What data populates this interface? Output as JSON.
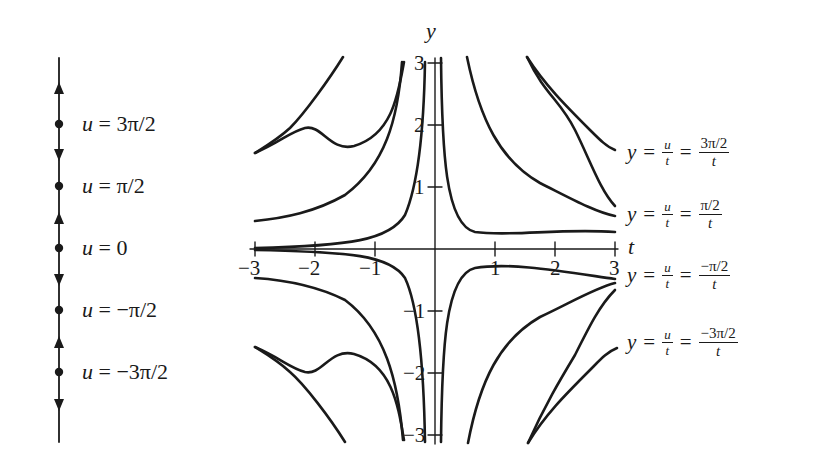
{
  "figure": {
    "colors": {
      "ink": "#1a1a1a",
      "background": "#ffffff"
    }
  },
  "phase_line": {
    "equilibria": [
      {
        "label_var": "u",
        "label_eq": "=",
        "label_value": "3π/2",
        "type": "equilibrium"
      },
      {
        "label_var": "u",
        "label_eq": "=",
        "label_value": "π/2",
        "type": "equilibrium"
      },
      {
        "label_var": "u",
        "label_eq": "=",
        "label_value": "0",
        "type": "equilibrium"
      },
      {
        "label_var": "u",
        "label_eq": "=",
        "label_value": "−π/2",
        "type": "equilibrium"
      },
      {
        "label_var": "u",
        "label_eq": "=",
        "label_value": "−3π/2",
        "type": "equilibrium"
      }
    ],
    "arrows": [
      "up",
      "down",
      "up",
      "down",
      "up",
      "down"
    ]
  },
  "plot": {
    "x_axis_label": "t",
    "y_axis_label": "y",
    "x_ticks": [
      "−3",
      "−2",
      "−1",
      "1",
      "2",
      "3"
    ],
    "y_ticks": [
      "3",
      "2",
      "1",
      "−1",
      "−2",
      "−3"
    ],
    "xlim": [
      -3,
      3
    ],
    "ylim": [
      -3,
      3
    ]
  },
  "curve_labels": [
    {
      "lhs": "y",
      "eq1": "=",
      "frac1_num": "u",
      "frac1_den": "t",
      "eq2": "=",
      "frac2_num": "3π/2",
      "frac2_den": "t"
    },
    {
      "lhs": "y",
      "eq1": "=",
      "frac1_num": "u",
      "frac1_den": "t",
      "eq2": "=",
      "frac2_num": "π/2",
      "frac2_den": "t"
    },
    {
      "lhs": "y",
      "eq1": "=",
      "frac1_num": "u",
      "frac1_den": "t",
      "eq2": "=",
      "frac2_num": "−π/2",
      "frac2_den": "t"
    },
    {
      "lhs": "y",
      "eq1": "=",
      "frac1_num": "u",
      "frac1_den": "t",
      "eq2": "=",
      "frac2_num": "−3π/2",
      "frac2_den": "t"
    }
  ]
}
